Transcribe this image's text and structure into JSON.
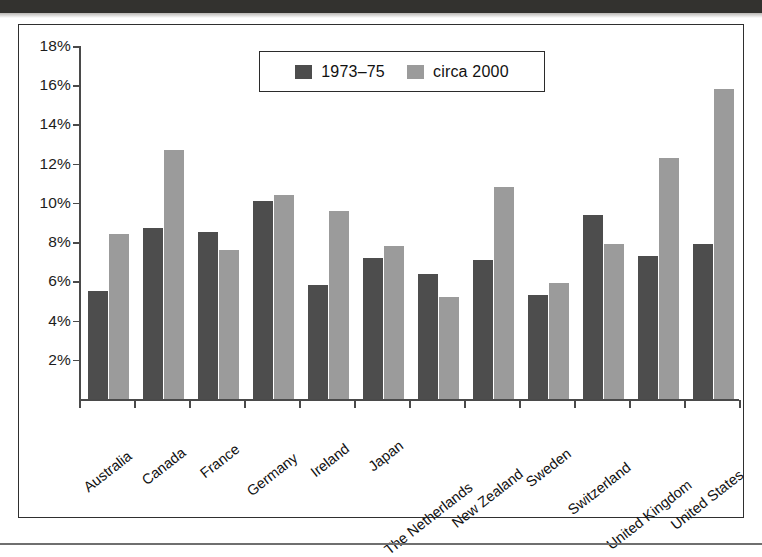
{
  "chart_data": {
    "type": "bar",
    "title": "",
    "xlabel": "",
    "ylabel": "",
    "ylim": [
      0,
      18
    ],
    "ytick_values": [
      2,
      4,
      6,
      8,
      10,
      12,
      14,
      16,
      18
    ],
    "ytick_labels": [
      "2%",
      "4%",
      "6%",
      "8%",
      "10%",
      "12%",
      "14%",
      "16%",
      "18%"
    ],
    "grid": false,
    "legend_position": "top-center",
    "categories": [
      "Australia",
      "Canada",
      "France",
      "Germany",
      "Ireland",
      "Japan",
      "The Netherlands",
      "New Zealand",
      "Sweden",
      "Switzerland",
      "United Kingdom",
      "United States"
    ],
    "series": [
      {
        "name": "1973-75",
        "color": "#4d4d4d",
        "values": [
          5.5,
          8.7,
          8.5,
          10.1,
          5.8,
          7.2,
          6.4,
          7.1,
          5.3,
          9.4,
          7.3,
          7.9
        ]
      },
      {
        "name": "circa 2000",
        "color": "#9b9b9b",
        "values": [
          8.4,
          12.7,
          7.6,
          10.4,
          9.6,
          7.8,
          5.2,
          10.8,
          5.9,
          7.9,
          12.3,
          15.8
        ]
      }
    ]
  },
  "legend": {
    "entries": [
      {
        "label": "1973–75",
        "swatch": "dark-swatch"
      },
      {
        "label": "circa 2000",
        "swatch": "light-swatch"
      }
    ]
  }
}
